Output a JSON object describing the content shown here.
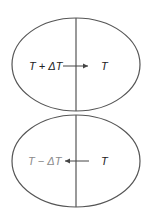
{
  "diagram": {
    "top_region": {
      "left_label": "T + ΔT",
      "right_label": "T",
      "arrow_direction": "right",
      "label_color": "#222222"
    },
    "bottom_region": {
      "left_label": "T − ΔT",
      "right_label": "T",
      "arrow_direction": "left",
      "left_label_color": "#8a8a8a",
      "right_label_color": "#222222"
    },
    "stroke_color": "#555555"
  }
}
